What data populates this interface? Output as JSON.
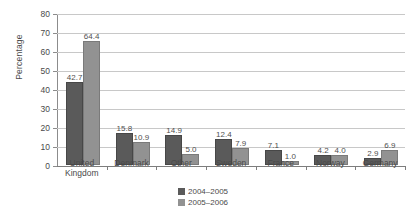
{
  "chart_data": {
    "type": "bar",
    "title": "",
    "xlabel": "",
    "ylabel": "Percentage",
    "ylim": [
      0,
      80
    ],
    "yticks": [
      0,
      10,
      20,
      30,
      40,
      50,
      60,
      70,
      80
    ],
    "grid": true,
    "legend_position": "bottom-center",
    "categories": [
      "United\nKingdom",
      "Denmark",
      "Other",
      "Sweden",
      "France",
      "Norway",
      "Germany"
    ],
    "series": [
      {
        "name": "2004–2005",
        "color": "#5a5a5a",
        "values": [
          42.7,
          15.8,
          14.9,
          12.4,
          7.1,
          4.2,
          2.9
        ]
      },
      {
        "name": "2005–2006",
        "color": "#929292",
        "values": [
          64.4,
          10.9,
          5.0,
          7.9,
          1.0,
          4.0,
          6.9
        ]
      }
    ],
    "value_labels": [
      [
        "42.7",
        "15.8",
        "14.9",
        "12.4",
        "7.1",
        "4.2",
        "2.9"
      ],
      [
        "64.4",
        "10.9",
        "5.0",
        "7.9",
        "1.0",
        "4.0",
        "6.9"
      ]
    ],
    "ytick_labels": [
      "0",
      "10",
      "20",
      "30",
      "40",
      "50",
      "60",
      "70",
      "80"
    ]
  }
}
